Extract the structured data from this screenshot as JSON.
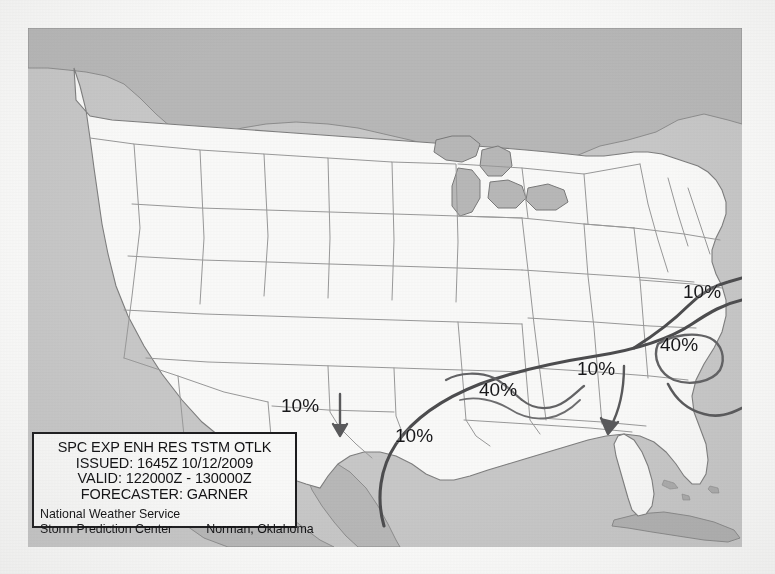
{
  "document": {
    "type": "scanned-page",
    "figure_kind": "weather-outlook-map"
  },
  "map": {
    "name": "SPC Experimental Enhanced Resolution Thunderstorm Outlook",
    "region": "Continental United States",
    "colors": {
      "ocean": "#c9c9c9",
      "land_conus": "#fbfbfa",
      "land_foreign": "#b9b9b9",
      "border": "#8a8a8a",
      "contour": "#4a4a4c",
      "text": "#18181a"
    }
  },
  "probability_labels": [
    {
      "id": "p1",
      "text": "10%",
      "x": 683,
      "y": 281,
      "area": "mid-atlantic-coast"
    },
    {
      "id": "p2",
      "text": "40%",
      "x": 660,
      "y": 334,
      "area": "carolina-coast"
    },
    {
      "id": "p3",
      "text": "10%",
      "x": 577,
      "y": 358,
      "area": "georgia-alabama"
    },
    {
      "id": "p4",
      "text": "40%",
      "x": 479,
      "y": 379,
      "area": "gulf-coast-louisiana"
    },
    {
      "id": "p5",
      "text": "10%",
      "x": 395,
      "y": 425,
      "area": "south-texas-coast"
    },
    {
      "id": "p6",
      "text": "10%",
      "x": 281,
      "y": 395,
      "area": "west-texas"
    }
  ],
  "legend": {
    "title": "SPC EXP ENH RES TSTM OTLK",
    "issued": "ISSUED: 1645Z 10/12/2009",
    "valid": "VALID: 122000Z - 130000Z",
    "forecaster": "FORECASTER: GARNER",
    "agency": "National Weather Service",
    "center": "Storm Prediction Center",
    "location": "Norman, Oklahoma"
  },
  "bleed_text": [
    {
      "text": "possible, the parameter space will sup-",
      "x": 452,
      "y": 84
    },
    {
      "text": "at least into the early",
      "x": 470,
      "y": 114
    },
    {
      "text": "hours, a few strong to severe storms",
      "x": 430,
      "y": 140
    },
    {
      "text": "are anticipated across parts of the",
      "x": 438,
      "y": 166
    },
    {
      "text": "region, and damaging wind",
      "x": 452,
      "y": 192
    },
    {
      "text": "gusts or isolated tornado cannot be",
      "x": 430,
      "y": 218
    },
    {
      "text": "ruled out. Otherwise, a risk for strong",
      "x": 424,
      "y": 244
    },
    {
      "text": "to severe storms appears minimal",
      "x": 434,
      "y": 270
    },
    {
      "text": "elsewhere.",
      "x": 452,
      "y": 296
    },
    {
      "text": "references",
      "x": 36,
      "y": 356
    },
    {
      "text": "Resources",
      "x": 612,
      "y": 340
    }
  ]
}
